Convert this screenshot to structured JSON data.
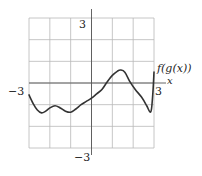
{
  "chart_data": {
    "type": "line",
    "title": "",
    "xlabel": "x",
    "ylabel": "",
    "xlim": [
      -3,
      3
    ],
    "ylim": [
      -3,
      3
    ],
    "grid": true,
    "grid_step": 1,
    "tick_labels": {
      "x_min": "−3",
      "x_max": "3",
      "y_max": "3",
      "y_min": "−3"
    },
    "series": [
      {
        "name": "f(g(x))",
        "x": [
          -3.0,
          -2.8,
          -2.6,
          -2.4,
          -2.2,
          -2.0,
          -1.75,
          -1.5,
          -1.25,
          -1.0,
          -0.75,
          -0.5,
          -0.25,
          0.0,
          0.25,
          0.5,
          0.75,
          1.0,
          1.25,
          1.4,
          1.6,
          1.85,
          2.1,
          2.4,
          2.65,
          2.8,
          2.88,
          2.95,
          3.0
        ],
        "values": [
          -0.55,
          -0.95,
          -1.25,
          -1.38,
          -1.3,
          -1.15,
          -1.05,
          -1.15,
          -1.3,
          -1.35,
          -1.2,
          -1.0,
          -0.85,
          -0.7,
          -0.5,
          -0.3,
          0.05,
          0.35,
          0.55,
          0.6,
          0.5,
          0.05,
          -0.3,
          -0.65,
          -1.05,
          -1.33,
          -1.2,
          -0.4,
          0.5
        ]
      }
    ]
  },
  "labels": {
    "curve": "f(g(x))",
    "x_axis": "x",
    "x_min": "−3",
    "x_max": "3",
    "y_max": "3",
    "y_min": "−3"
  },
  "colors": {
    "grid": "#b8b8b8",
    "axis": "#555555",
    "curve": "#333333"
  }
}
